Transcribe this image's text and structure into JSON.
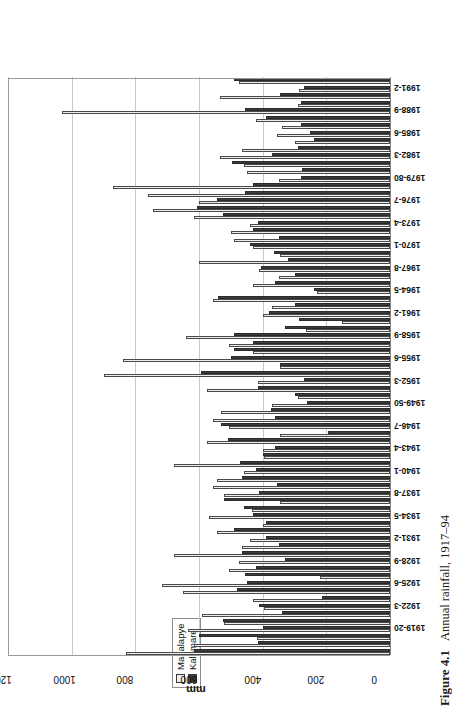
{
  "figure": {
    "caption_number": "Figure 4.1",
    "caption_text": "Annual rainfall, 1917–94"
  },
  "legend": {
    "position": "top-center",
    "items": [
      {
        "label": "Mahalapye",
        "swatch": "light-square-swatch",
        "color": "#ededed"
      },
      {
        "label": "Kalamare",
        "swatch": "dark-square-swatch",
        "color": "#3d3d3d"
      }
    ]
  },
  "axes": {
    "value_axis_title": "mm",
    "value_ticks": [
      "0",
      "200",
      "400",
      "600",
      "800",
      "1000",
      "1200"
    ],
    "category_axis_title": ""
  },
  "chart_data": {
    "type": "bar",
    "orientation": "horizontal",
    "title": "",
    "subtitle": "",
    "xlabel": "",
    "ylabel": "mm",
    "ylim": [
      0,
      1200
    ],
    "ytick_step": 200,
    "grid": true,
    "legend_position": "top-center",
    "categories": [
      "1917-18",
      "1918-19",
      "1919-20",
      "1920-1",
      "1921-2",
      "1922-3",
      "1923-4",
      "1924-5",
      "1925-6",
      "1926-7",
      "1927-8",
      "1928-9",
      "1929-30",
      "1930-1",
      "1931-2",
      "1932-3",
      "1933-4",
      "1934-5",
      "1935-6",
      "1936-7",
      "1937-8",
      "1938-9",
      "1939-40",
      "1940-1",
      "1941-2",
      "1942-3",
      "1943-4",
      "1944-5",
      "1945-6",
      "1946-7",
      "1947-8",
      "1948-9",
      "1949-50",
      "1950-1",
      "1951-2",
      "1952-3",
      "1953-4",
      "1954-5",
      "1955-6",
      "1956-7",
      "1957-8",
      "1958-9",
      "1959-60",
      "1960-1",
      "1961-2",
      "1962-3",
      "1963-4",
      "1964-5",
      "1965-6",
      "1966-7",
      "1967-8",
      "1968-9",
      "1969-70",
      "1970-1",
      "1971-2",
      "1972-3",
      "1973-4",
      "1974-5",
      "1975-6",
      "1976-7",
      "1977-8",
      "1978-9",
      "1979-80",
      "1980-1",
      "1981-2",
      "1982-3",
      "1983-4",
      "1984-5",
      "1985-6",
      "1986-7",
      "1987-8",
      "1988-9",
      "1989-90",
      "1990-1",
      "1991-2",
      "1992-3",
      "1993-4"
    ],
    "tick_labels_shown": [
      "1919-20",
      "1922-3",
      "1925-6",
      "1928-9",
      "1931-2",
      "1934-5",
      "1937-8",
      "1940-1",
      "1943-4",
      "1946-7",
      "1949-50",
      "1952-3",
      "1955-6",
      "1958-9",
      "1961-2",
      "1964-5",
      "1967-8",
      "1970-1",
      "1973-4",
      "1976-7",
      "1979-80",
      "1982-3",
      "1985-6",
      "1988-9",
      "1991-2"
    ],
    "series": [
      {
        "name": "Mahalapye",
        "color": "#ededed",
        "values": [
          830,
          615,
          418,
          635,
          520,
          590,
          395,
          430,
          650,
          715,
          220,
          505,
          475,
          680,
          465,
          440,
          545,
          400,
          570,
          435,
          345,
          520,
          555,
          545,
          460,
          680,
          395,
          400,
          575,
          345,
          505,
          555,
          530,
          370,
          290,
          575,
          415,
          900,
          345,
          840,
          430,
          505,
          640,
          265,
          150,
          400,
          370,
          555,
          230,
          430,
          350,
          410,
          600,
          345,
          430,
          490,
          500,
          440,
          615,
          745,
          600,
          760,
          870,
          350,
          450,
          460,
          535,
          465,
          300,
          355,
          340,
          420,
          1030,
          290,
          535,
          285,
          475
        ]
      },
      {
        "name": "Kalamare",
        "color": "#3d3d3d",
        "values": [
          615,
          415,
          600,
          398,
          525,
          340,
          410,
          215,
          480,
          450,
          455,
          420,
          330,
          465,
          350,
          390,
          490,
          390,
          430,
          460,
          520,
          410,
          355,
          465,
          420,
          470,
          400,
          360,
          510,
          195,
          530,
          360,
          375,
          260,
          300,
          415,
          270,
          595,
          345,
          500,
          490,
          430,
          490,
          330,
          285,
          380,
          300,
          540,
          240,
          360,
          300,
          405,
          320,
          365,
          440,
          350,
          430,
          415,
          525,
          605,
          545,
          455,
          430,
          280,
          275,
          495,
          370,
          290,
          240,
          250,
          280,
          390,
          455,
          280,
          345,
          270,
          490
        ]
      }
    ]
  }
}
